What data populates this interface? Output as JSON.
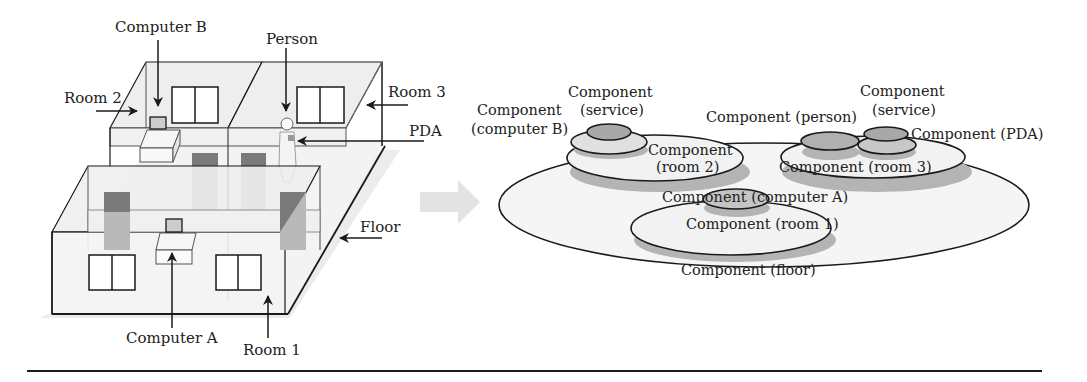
{
  "left_diagram": {
    "labels": {
      "computer_b": "Computer B",
      "person": "Person",
      "room_2": "Room 2",
      "room_3": "Room 3",
      "pda": "PDA",
      "floor": "Floor",
      "computer_a": "Computer A",
      "room_1": "Room 1"
    }
  },
  "right_diagram": {
    "labels": {
      "service_left_1": "Component",
      "service_left_2": "(service)",
      "computer_b_1": "Component",
      "computer_b_2": "(computer B)",
      "room_2_1": "Component",
      "room_2_2": "(room 2)",
      "person": "Component (person)",
      "service_right_1": "Component",
      "service_right_2": "(service)",
      "pda": "Component (PDA)",
      "room_3": "Component (room 3)",
      "computer_a": "Component (computer A)",
      "room_1": "Component (room 1)",
      "floor": "Component (floor)"
    }
  },
  "colors": {
    "line": "#1a1a1a",
    "wall_fill": "#efefef",
    "door_dark": "#7a7a7a",
    "door_light": "#b9b9b9",
    "shadow": "#b4b4b4",
    "ellipse_fill": "#f2f2f2",
    "inner_fill": "#a8a8a8",
    "arrow_fill": "#e3e3e3"
  }
}
